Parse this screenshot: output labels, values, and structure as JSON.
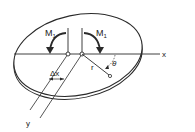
{
  "diagram": {
    "type": "plate-bending-schematic",
    "colors": {
      "stroke": "#2a2a2a",
      "background": "#ffffff",
      "text": "#222222"
    },
    "labels": {
      "moment_left": "M",
      "moment_left_sub": "1",
      "moment_right": "M",
      "moment_right_sub": "1",
      "x_axis": "x",
      "y_axis": "y",
      "delta_x": "Δx",
      "radius": "r",
      "angle": "θ"
    },
    "elements": [
      {
        "id": "plate",
        "shape": "ellipse",
        "with_thickness": true
      },
      {
        "id": "x-axis",
        "shape": "line"
      },
      {
        "id": "y-axis-lines",
        "shape": "parallel-lines",
        "count": 2
      },
      {
        "id": "hinge-points",
        "shape": "circle",
        "count": 2
      },
      {
        "id": "moment-arrows",
        "shape": "curved-arrow",
        "count": 2
      },
      {
        "id": "radial-line",
        "shape": "line-with-end-circle"
      },
      {
        "id": "angle-arc",
        "shape": "dashed-arc"
      }
    ]
  }
}
